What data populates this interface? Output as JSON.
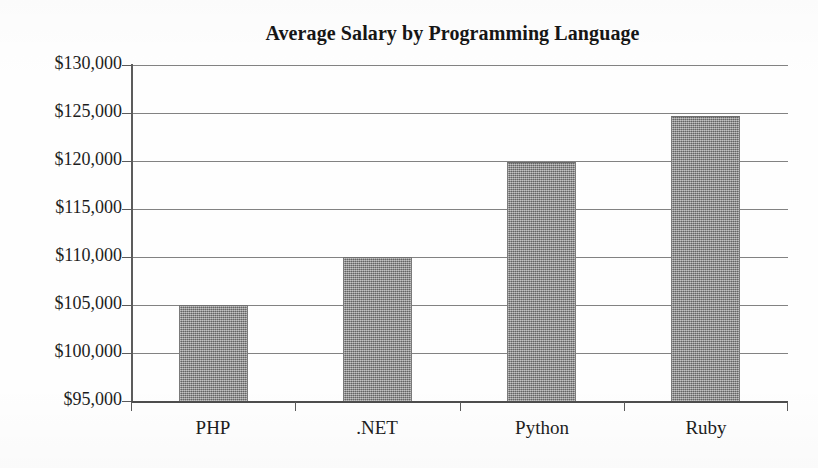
{
  "chart_data": {
    "type": "bar",
    "title": "Average Salary by Programming Language",
    "xlabel": "",
    "ylabel": "",
    "categories": [
      "PHP",
      ".NET",
      "Python",
      "Ruby"
    ],
    "values": [
      105000,
      110000,
      119900,
      124700
    ],
    "ylim": [
      95000,
      130000
    ],
    "ytick_values": [
      130000,
      125000,
      120000,
      115000,
      110000,
      105000,
      100000,
      95000
    ],
    "ytick_labels": [
      "$130,000",
      "$125,000",
      "$120,000",
      "$115,000",
      "$110,000",
      "$105,000",
      "$100,000",
      "$95,000"
    ],
    "ytick_step": 5000,
    "grid": true,
    "grid_axis": "y",
    "legend": null,
    "legend_position": "none",
    "bar_color": "#8b8b8b",
    "background_color": "#ffffff",
    "axis_color": "#4d4d4d",
    "grid_color": "#6d6d6d",
    "series": [
      {
        "name": "Average Salary",
        "values": [
          105000,
          110000,
          119900,
          124700
        ]
      }
    ]
  }
}
